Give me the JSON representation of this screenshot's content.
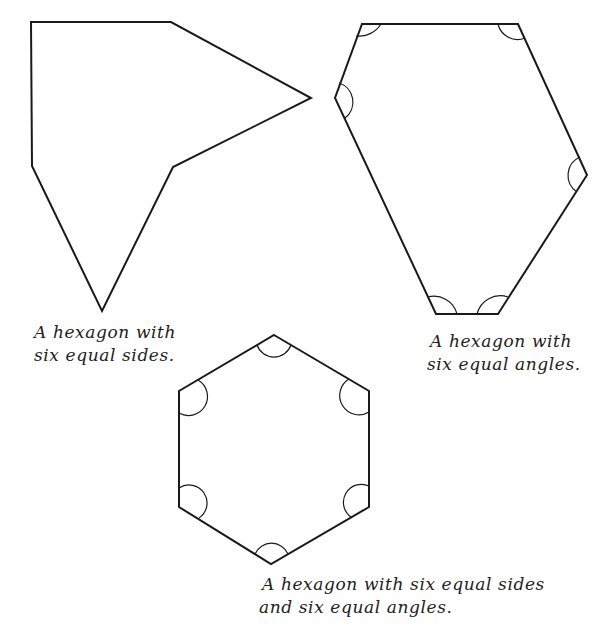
{
  "figure": {
    "shapes": [
      {
        "id": "hexagon-equal-sides",
        "caption_line1": "A hexagon with",
        "caption_line2": "six equal sides."
      },
      {
        "id": "hexagon-equal-angles",
        "caption_line1": "A hexagon with",
        "caption_line2": "six equal angles."
      },
      {
        "id": "regular-hexagon",
        "caption_line1": "A hexagon with six equal sides",
        "caption_line2": "and six equal angles."
      }
    ]
  }
}
